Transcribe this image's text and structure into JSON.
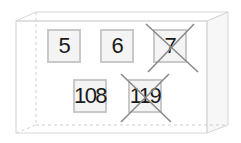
{
  "diagram": {
    "container": {
      "shape": "3d-box",
      "line_color": "#d6d6d6",
      "side_fill": "#f7f7f7"
    },
    "cards": [
      {
        "label": "5",
        "crossed": false,
        "row": 1,
        "col": 1
      },
      {
        "label": "6",
        "crossed": false,
        "row": 1,
        "col": 2
      },
      {
        "label": "7",
        "crossed": true,
        "row": 1,
        "col": 3
      },
      {
        "label": "108",
        "crossed": false,
        "row": 2,
        "col": 1
      },
      {
        "label": "119",
        "crossed": true,
        "row": 2,
        "col": 2
      }
    ],
    "colors": {
      "card_border": "#c9c9c9",
      "card_fill": "#f4f4f4",
      "text": "#1a1a1a",
      "cross": "#8a8a8a"
    }
  }
}
